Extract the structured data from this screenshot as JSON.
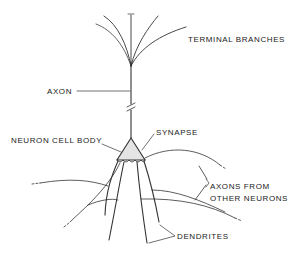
{
  "diagram": {
    "title": "",
    "labels": {
      "terminal_branches": "TERMINAL BRANCHES",
      "axon": "AXON",
      "neuron_cell_body": "NEURON CELL BODY",
      "synapse": "SYNAPSE",
      "axons_from_line1": "AXONS FROM",
      "axons_from_line2": "OTHER NEURONS",
      "dendrites": "DENDRITES"
    },
    "colors": {
      "line": "#333333",
      "cell_body_fill": "#e4e4e4",
      "text": "#222222",
      "background": "#ffffff"
    }
  }
}
